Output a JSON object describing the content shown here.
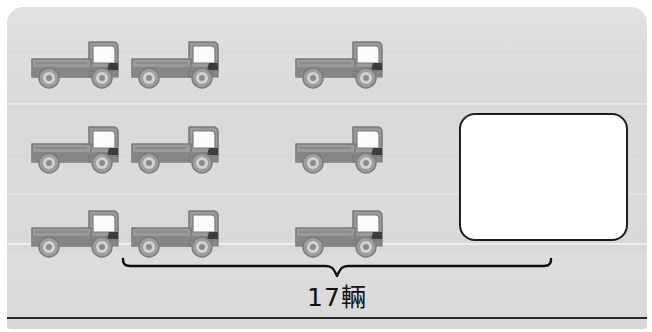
{
  "worksheet": {
    "title": "17輛",
    "caption": "17輛",
    "card_background_color": "#dcdcdc",
    "rule_color": "#2a2a2a"
  },
  "answer_box": {
    "name": "answer-box",
    "value": "",
    "placeholder": "",
    "fill_color": "#ffffff",
    "border_color": "#1d1d1d"
  },
  "brace": {
    "label": "17輛",
    "color": "#111111"
  },
  "truck_icon": {
    "icon_name": "truck-icon",
    "body_color": "#9a9a9a",
    "body_shade_color": "#868686",
    "outline_color": "#7a7a7a",
    "window_color": "#fbfbfb",
    "wheel_color": "#9d9d9d",
    "wheel_rim_color": "#d2d2d2",
    "wheel_hub_color": "#8a8a8a",
    "arch_color": "#3c3c3c"
  },
  "trucks": {
    "total_visible": 9,
    "rows": [
      {
        "row_index": 1,
        "items": [
          {
            "index": 1,
            "label": "truck-1",
            "x": 22,
            "y": 30
          },
          {
            "index": 2,
            "label": "truck-2",
            "x": 122,
            "y": 30
          },
          {
            "index": 3,
            "label": "truck-3",
            "x": 286,
            "y": 30
          }
        ]
      },
      {
        "row_index": 2,
        "items": [
          {
            "index": 4,
            "label": "truck-4",
            "x": 22,
            "y": 115
          },
          {
            "index": 5,
            "label": "truck-5",
            "x": 122,
            "y": 115
          },
          {
            "index": 6,
            "label": "truck-6",
            "x": 286,
            "y": 115
          }
        ]
      },
      {
        "row_index": 3,
        "items": [
          {
            "index": 7,
            "label": "truck-7",
            "x": 22,
            "y": 199
          },
          {
            "index": 8,
            "label": "truck-8",
            "x": 122,
            "y": 199
          },
          {
            "index": 9,
            "label": "truck-9",
            "x": 286,
            "y": 199
          }
        ]
      }
    ]
  }
}
